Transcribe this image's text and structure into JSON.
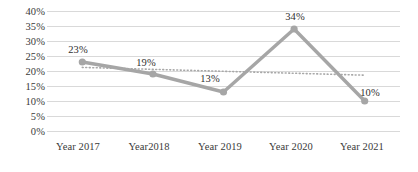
{
  "chart_data": {
    "type": "line",
    "title": "",
    "subtitle": "",
    "xlabel": "",
    "ylabel": "",
    "categories": [
      "Year 2017",
      "Year2018",
      "Year 2019",
      "Year 2020",
      "Year 2021"
    ],
    "series": [
      {
        "name": "Series 1",
        "values": [
          23,
          19,
          13,
          34,
          10
        ],
        "data_labels": [
          "23%",
          "19%",
          "13%",
          "34%",
          "10%"
        ],
        "color": "#a6a6a6",
        "marker": "circle",
        "line_style": "solid"
      },
      {
        "name": "Trendline",
        "line_style": "dotted",
        "color": "#a6a6a6",
        "start_value": 21.2,
        "end_value": 18.6
      }
    ],
    "ylim": [
      0,
      40
    ],
    "ytick_step": 5,
    "ytick_labels": [
      "40%",
      "35%",
      "30%",
      "25%",
      "20%",
      "15%",
      "10%",
      "5%",
      "0%"
    ],
    "ytick_values": [
      40,
      35,
      30,
      25,
      20,
      15,
      10,
      5,
      0
    ],
    "grid": true,
    "grid_color": "#d9d9d9",
    "legend": false,
    "legend_position": "none",
    "background": "#ffffff"
  }
}
